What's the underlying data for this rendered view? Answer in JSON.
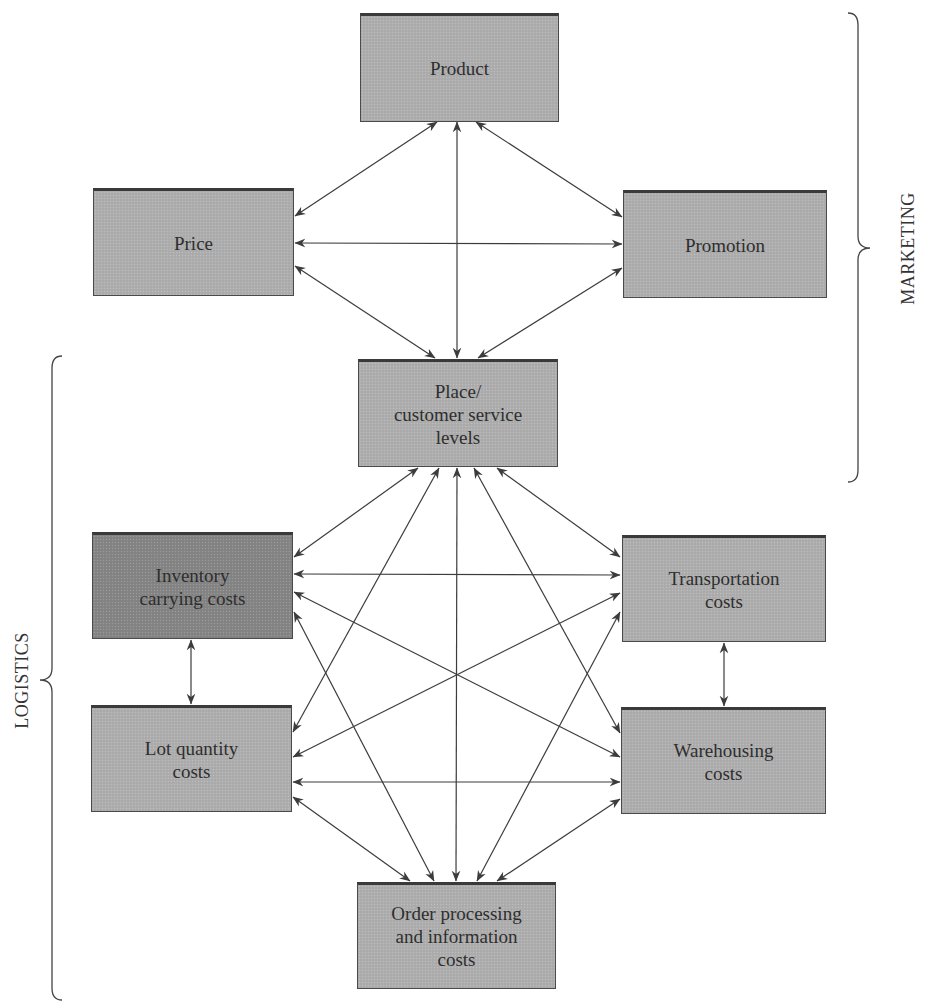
{
  "diagram": {
    "type": "relationship-diagram",
    "groups": {
      "marketing": {
        "label": "MARKETING"
      },
      "logistics": {
        "label": "LOGISTICS"
      }
    },
    "nodes": {
      "product": {
        "label": "Product",
        "x": 360,
        "y": 13,
        "w": 199,
        "h": 109,
        "group": "marketing"
      },
      "price": {
        "label": "Price",
        "x": 93,
        "y": 188,
        "w": 201,
        "h": 108,
        "group": "marketing"
      },
      "promotion": {
        "label": "Promotion",
        "x": 623,
        "y": 190,
        "w": 204,
        "h": 108,
        "group": "marketing"
      },
      "place": {
        "label": "Place/\ncustomer service\nlevels",
        "x": 358,
        "y": 359,
        "w": 200,
        "h": 108,
        "group": "both"
      },
      "inventory": {
        "label": "Inventory\ncarrying costs",
        "x": 92,
        "y": 532,
        "w": 201,
        "h": 107,
        "group": "logistics",
        "highlight": true
      },
      "transportation": {
        "label": "Transportation\ncosts",
        "x": 622,
        "y": 535,
        "w": 204,
        "h": 107,
        "group": "logistics"
      },
      "lot": {
        "label": "Lot quantity\ncosts",
        "x": 91,
        "y": 705,
        "w": 201,
        "h": 107,
        "group": "logistics"
      },
      "warehousing": {
        "label": "Warehousing\ncosts",
        "x": 621,
        "y": 707,
        "w": 205,
        "h": 107,
        "group": "logistics"
      },
      "order": {
        "label": "Order processing\nand information\ncosts",
        "x": 357,
        "y": 882,
        "w": 199,
        "h": 107,
        "group": "logistics"
      }
    },
    "edges": [
      {
        "from": "product",
        "to": "price",
        "x1": 437,
        "y1": 122,
        "x2": 295,
        "y2": 216
      },
      {
        "from": "product",
        "to": "place",
        "x1": 457,
        "y1": 122,
        "x2": 457,
        "y2": 358
      },
      {
        "from": "product",
        "to": "promotion",
        "x1": 476,
        "y1": 122,
        "x2": 622,
        "y2": 217
      },
      {
        "from": "price",
        "to": "promotion",
        "x1": 295,
        "y1": 243,
        "x2": 622,
        "y2": 244
      },
      {
        "from": "price",
        "to": "place",
        "x1": 295,
        "y1": 266,
        "x2": 435,
        "y2": 358
      },
      {
        "from": "promotion",
        "to": "place",
        "x1": 622,
        "y1": 268,
        "x2": 478,
        "y2": 358
      },
      {
        "from": "place",
        "to": "inventory",
        "x1": 418,
        "y1": 468,
        "x2": 294,
        "y2": 557
      },
      {
        "from": "place",
        "to": "lot",
        "x1": 439,
        "y1": 468,
        "x2": 293,
        "y2": 732
      },
      {
        "from": "place",
        "to": "order",
        "x1": 457,
        "y1": 468,
        "x2": 456,
        "y2": 881
      },
      {
        "from": "place",
        "to": "warehousing",
        "x1": 474,
        "y1": 468,
        "x2": 620,
        "y2": 733
      },
      {
        "from": "place",
        "to": "transportation",
        "x1": 497,
        "y1": 468,
        "x2": 620,
        "y2": 557
      },
      {
        "from": "inventory",
        "to": "transportation",
        "x1": 294,
        "y1": 574,
        "x2": 620,
        "y2": 575
      },
      {
        "from": "inventory",
        "to": "warehousing",
        "x1": 294,
        "y1": 592,
        "x2": 620,
        "y2": 757
      },
      {
        "from": "inventory",
        "to": "order",
        "x1": 294,
        "y1": 612,
        "x2": 434,
        "y2": 881
      },
      {
        "from": "inventory",
        "to": "lot",
        "x1": 191,
        "y1": 640,
        "x2": 191,
        "y2": 704
      },
      {
        "from": "transportation",
        "to": "lot",
        "x1": 620,
        "y1": 593,
        "x2": 293,
        "y2": 757
      },
      {
        "from": "transportation",
        "to": "order",
        "x1": 620,
        "y1": 612,
        "x2": 477,
        "y2": 881
      },
      {
        "from": "transportation",
        "to": "warehousing",
        "x1": 724,
        "y1": 643,
        "x2": 724,
        "y2": 706
      },
      {
        "from": "lot",
        "to": "warehousing",
        "x1": 293,
        "y1": 782,
        "x2": 620,
        "y2": 782
      },
      {
        "from": "lot",
        "to": "order",
        "x1": 293,
        "y1": 797,
        "x2": 410,
        "y2": 881
      },
      {
        "from": "warehousing",
        "to": "order",
        "x1": 620,
        "y1": 799,
        "x2": 497,
        "y2": 881
      }
    ],
    "braces": {
      "marketing": {
        "x": 858,
        "y1": 13,
        "y2": 482,
        "tip_y": 248,
        "side": "right"
      },
      "logistics": {
        "x": 52,
        "y1": 356,
        "y2": 1000,
        "tip_y": 680,
        "side": "left"
      }
    },
    "colors": {
      "box_fill": "#aeaeae",
      "box_fill_highlight": "#858585",
      "box_border": "#4a4a4a",
      "arrow": "#3c3c3c",
      "text": "#2e2e2e"
    }
  }
}
